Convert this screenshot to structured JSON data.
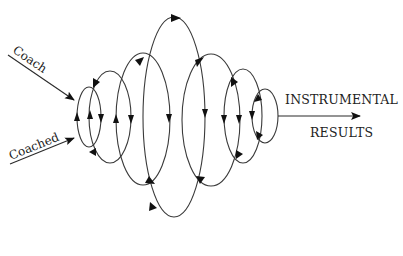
{
  "diagram": {
    "title": "",
    "inputs": [
      {
        "id": "coach",
        "label": "Coach"
      },
      {
        "id": "coached",
        "label": "Coached"
      }
    ],
    "output": {
      "line1": "INSTRUMENTAL",
      "line2": "RESULTS"
    },
    "loops": [
      {
        "id": "loop-1",
        "cx": 89,
        "cy": 117,
        "rx": 12,
        "ry": 30,
        "direction": "counter-clockwise"
      },
      {
        "id": "loop-2",
        "cx": 110,
        "cy": 117,
        "rx": 21,
        "ry": 46,
        "direction": "counter-clockwise"
      },
      {
        "id": "loop-3",
        "cx": 143,
        "cy": 119,
        "rx": 27,
        "ry": 66,
        "direction": "counter-clockwise"
      },
      {
        "id": "loop-4",
        "cx": 174,
        "cy": 117,
        "rx": 31,
        "ry": 100,
        "direction": "clockwise"
      },
      {
        "id": "loop-5",
        "cx": 211,
        "cy": 120,
        "rx": 29,
        "ry": 66,
        "direction": "clockwise"
      },
      {
        "id": "loop-6",
        "cx": 243,
        "cy": 116,
        "rx": 19,
        "ry": 47,
        "direction": "clockwise"
      },
      {
        "id": "loop-7",
        "cx": 265,
        "cy": 116,
        "rx": 13,
        "ry": 27,
        "direction": "clockwise"
      }
    ],
    "colors": {
      "stroke": "#3a3a3a",
      "arrowhead": "#111111",
      "background": "#ffffff"
    }
  }
}
